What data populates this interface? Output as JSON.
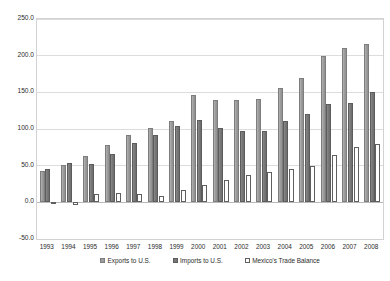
{
  "chart_data": {
    "type": "bar",
    "title": "",
    "xlabel": "",
    "ylabel": "Billions US$",
    "ylim": [
      -50.0,
      250.0
    ],
    "ytick_step": 50.0,
    "ytick_labels": [
      "250.0",
      "200.0",
      "150.0",
      "100.0",
      "50.0",
      "0.0",
      "-50.0"
    ],
    "ytick_values": [
      250.0,
      200.0,
      150.0,
      100.0,
      50.0,
      0.0,
      -50.0
    ],
    "grid": true,
    "legend_position": "bottom",
    "categories": [
      "1993",
      "1994",
      "1995",
      "1996",
      "1997",
      "1998",
      "1999",
      "2000",
      "2001",
      "2002",
      "2003",
      "2004",
      "2005",
      "2006",
      "2007",
      "2008"
    ],
    "series": [
      {
        "name": "Exports to U.S.",
        "color": "#9d9d9d",
        "values": [
          43,
          51,
          63,
          78,
          92,
          101,
          111,
          146,
          140,
          140,
          141,
          156,
          170,
          199,
          211,
          216
        ]
      },
      {
        "name": "Imports to U.S.",
        "color": "#787878",
        "values": [
          45,
          53,
          52,
          66,
          81,
          92,
          104,
          112,
          101,
          97,
          97,
          111,
          120,
          134,
          136,
          151
        ]
      },
      {
        "name": "Mexico's Trade Balance",
        "color": "#ffffff",
        "values": [
          -2,
          -4,
          11,
          13,
          11,
          9,
          17,
          24,
          30,
          37,
          41,
          45,
          50,
          64,
          75,
          80
        ]
      }
    ]
  },
  "legend": {
    "entries": [
      {
        "label": "Exports to U.S.",
        "swatch": "exports"
      },
      {
        "label": "Imports to U.S.",
        "swatch": "imports"
      },
      {
        "label": "Mexico's Trade Balance",
        "swatch": "balance"
      }
    ]
  },
  "axis": {
    "y_title": "Billions US$"
  }
}
